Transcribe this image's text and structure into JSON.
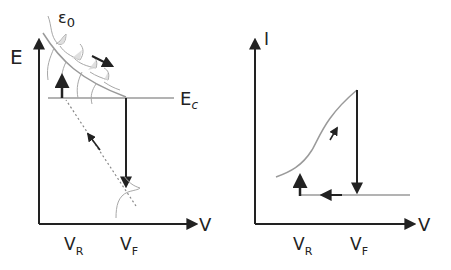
{
  "left_plot": {
    "y_axis_label": "E",
    "x_axis_label": "V",
    "epsilon_label": "ε",
    "epsilon_sub": "0",
    "ec_label": "E",
    "ec_sub": "c",
    "vr_label": "V",
    "vr_sub": "R",
    "vf_label": "V",
    "vf_sub": "F"
  },
  "right_plot": {
    "y_axis_label": "I",
    "x_axis_label": "V",
    "vr_label": "V",
    "vr_sub": "R",
    "vf_label": "V",
    "vf_sub": "F"
  },
  "colors": {
    "axis": "#222222",
    "curve": "#9a9a9a",
    "arrow": "#222222"
  }
}
